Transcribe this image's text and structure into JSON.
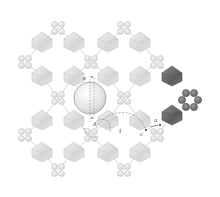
{
  "figure": {
    "type": "crystal-structure-diagram",
    "colors": {
      "background": "#ffffff",
      "octahedron_light": "#dcdcdc",
      "octahedron_light_edge": "#c4c4c4",
      "octahedron_dark": "#6e6e6e",
      "octahedron_dark_edge": "#4a4a4a",
      "linker_light": "#e2e2e2",
      "linker_dark": "#7a7a7a",
      "sphere": "#e8e8e8",
      "path": "#8a8a8a",
      "label": "#555555"
    },
    "labels": {
      "e": "e",
      "d": "d",
      "f": "f",
      "c": "c",
      "a": "a"
    },
    "octahedra_light": [
      [
        42,
        42
      ],
      [
        74,
        42
      ],
      [
        108,
        42
      ],
      [
        140,
        42
      ],
      [
        42,
        76
      ],
      [
        74,
        76
      ],
      [
        108,
        76
      ],
      [
        140,
        76
      ],
      [
        42,
        120
      ],
      [
        74,
        120
      ],
      [
        108,
        120
      ],
      [
        140,
        120
      ],
      [
        42,
        152
      ],
      [
        74,
        152
      ],
      [
        108,
        152
      ],
      [
        140,
        152
      ]
    ],
    "octahedra_dark": [
      [
        172,
        76
      ],
      [
        172,
        115
      ]
    ],
    "rings_light": [
      [
        58,
        28
      ],
      [
        124,
        28
      ],
      [
        25,
        62
      ],
      [
        91,
        62
      ],
      [
        157,
        62
      ],
      [
        58,
        98
      ],
      [
        124,
        98
      ],
      [
        25,
        135
      ],
      [
        91,
        135
      ],
      [
        157,
        135
      ],
      [
        58,
        170
      ],
      [
        124,
        170
      ]
    ],
    "ring_dark": [
      190,
      100
    ],
    "sphere": {
      "cx": 90,
      "cy": 98,
      "r": 16
    }
  }
}
